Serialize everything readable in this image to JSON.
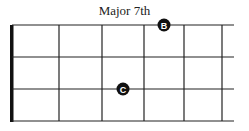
{
  "diagram": {
    "title": "Major 7th",
    "colors": {
      "line": "#222222",
      "dot": "#111111",
      "dot_text": "#ffffff"
    },
    "grid": {
      "nut_x": 12,
      "fret_x": [
        59,
        102,
        144,
        184,
        222
      ],
      "string_y": [
        25,
        57,
        89,
        121
      ],
      "right_x": 234
    },
    "notes": [
      {
        "label": "B",
        "x": 164,
        "y": 25
      },
      {
        "label": "C",
        "x": 123,
        "y": 89
      }
    ]
  }
}
